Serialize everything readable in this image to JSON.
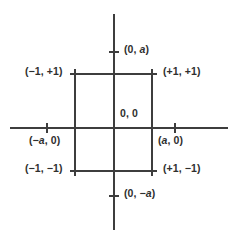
{
  "diagram": {
    "type": "cartesian-coordinate-diagram",
    "colors": {
      "background": "#ffffff",
      "line": "#3d3d3d",
      "text": "#2f2f2f"
    },
    "axes": {
      "vertical": {
        "x": 114,
        "y_start": 14,
        "y_end": 230
      },
      "horizontal": {
        "y": 128,
        "x_start": 10,
        "x_end": 228
      }
    },
    "square": {
      "left": 75,
      "right": 152,
      "top": 74,
      "bottom": 171
    },
    "origin": {
      "x": 114,
      "y": 128
    },
    "points": [
      {
        "name": "top-intercept",
        "x": 114,
        "y": 52,
        "label_parts": [
          "(0, ",
          "a",
          ")"
        ]
      },
      {
        "name": "top-left-corner",
        "x": 75,
        "y": 74,
        "label_parts": [
          "(−1, +1)"
        ]
      },
      {
        "name": "top-right-corner",
        "x": 152,
        "y": 74,
        "label_parts": [
          "(+1, +1)"
        ]
      },
      {
        "name": "origin",
        "x": 114,
        "y": 128,
        "label_parts": [
          "0, 0"
        ]
      },
      {
        "name": "left-intercept",
        "x": 47,
        "y": 128,
        "label_parts": [
          "(−",
          "a",
          ", 0)"
        ]
      },
      {
        "name": "right-intercept",
        "x": 175,
        "y": 128,
        "label_parts": [
          "(",
          "a",
          ", 0)"
        ]
      },
      {
        "name": "bottom-left-corner",
        "x": 75,
        "y": 171,
        "label_parts": [
          "(−1, −1)"
        ]
      },
      {
        "name": "bottom-right-corner",
        "x": 152,
        "y": 171,
        "label_parts": [
          "(+1, −1)"
        ]
      },
      {
        "name": "bottom-intercept",
        "x": 114,
        "y": 196,
        "label_parts": [
          "(0, −",
          "a",
          ")"
        ]
      }
    ]
  },
  "labels": {
    "top": {
      "pre": "(0, ",
      "var": "a",
      "post": ")"
    },
    "top_left": {
      "pre": "(−1, +1)",
      "var": "",
      "post": ""
    },
    "top_right": {
      "pre": "(+1, +1)",
      "var": "",
      "post": ""
    },
    "origin": {
      "pre": "0, 0",
      "var": "",
      "post": ""
    },
    "left": {
      "pre": "(−",
      "var": "a",
      "post": ", 0)"
    },
    "right": {
      "pre": "(",
      "var": "a",
      "post": ", 0)"
    },
    "bottom_left": {
      "pre": "(−1, −1)",
      "var": "",
      "post": ""
    },
    "bottom_right": {
      "pre": "(+1, −1)",
      "var": "",
      "post": ""
    },
    "bottom": {
      "pre": "(0, −",
      "var": "a",
      "post": ")"
    }
  }
}
